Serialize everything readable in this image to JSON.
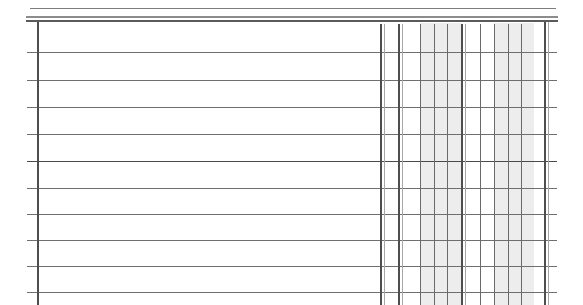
{
  "document": {
    "kind": "blank-ruled-table-grid",
    "title": "",
    "subtitle": "",
    "page_background": "#ffffff",
    "ink_color": "#6f6f6f",
    "shade_color": "#ededed",
    "canvas": {
      "width": 583,
      "height": 305
    }
  },
  "header_rules": [
    {
      "name": "masthead-top-rule",
      "x": 30,
      "y": 8,
      "width": 526,
      "thickness": 1,
      "tone": "#7d7d7d"
    },
    {
      "name": "masthead-mid-rule",
      "x": 26,
      "y": 16,
      "width": 532,
      "thickness": 2,
      "tone": "#8c8c8c"
    },
    {
      "name": "masthead-bottom-rule",
      "x": 26,
      "y": 20,
      "width": 532,
      "thickness": 2,
      "tone": "#5a5a5a"
    }
  ],
  "grid": {
    "left_border_x": 37,
    "right_border_x": 544,
    "body_top_y": 22,
    "body_bottom_y": 305,
    "row_rule_x_start": 27,
    "row_rule_x_end": 557,
    "row_rules_y": [
      52,
      80,
      107,
      134,
      161,
      188,
      214,
      240,
      266,
      292
    ],
    "row_count": 11,
    "row_height_avg": 27
  },
  "columns": {
    "label_column": {
      "name": "wide-label-column",
      "x_start": 37,
      "x_end": 380,
      "width": 343,
      "shaded": false,
      "header_text": "",
      "cells": [
        "",
        "",
        "",
        "",
        "",
        "",
        "",
        "",
        "",
        "",
        ""
      ]
    },
    "value_columns": [
      {
        "name": "value-col-1",
        "x": 380,
        "width": 18,
        "shaded": false,
        "header_text": "",
        "cells": [
          "",
          "",
          "",
          "",
          "",
          "",
          "",
          "",
          "",
          "",
          ""
        ]
      },
      {
        "name": "value-col-2",
        "x": 398,
        "width": 22,
        "shaded": false,
        "header_text": "",
        "cells": [
          "",
          "",
          "",
          "",
          "",
          "",
          "",
          "",
          "",
          "",
          ""
        ]
      },
      {
        "name": "value-col-3",
        "x": 420,
        "width": 14,
        "shaded": true,
        "header_text": "",
        "cells": [
          "",
          "",
          "",
          "",
          "",
          "",
          "",
          "",
          "",
          "",
          ""
        ]
      },
      {
        "name": "value-col-4",
        "x": 434,
        "width": 13,
        "shaded": true,
        "header_text": "",
        "cells": [
          "",
          "",
          "",
          "",
          "",
          "",
          "",
          "",
          "",
          "",
          ""
        ]
      },
      {
        "name": "value-col-5",
        "x": 447,
        "width": 14,
        "shaded": true,
        "header_text": "",
        "cells": [
          "",
          "",
          "",
          "",
          "",
          "",
          "",
          "",
          "",
          "",
          ""
        ]
      },
      {
        "name": "value-col-6",
        "x": 461,
        "width": 19,
        "shaded": false,
        "header_text": "",
        "cells": [
          "",
          "",
          "",
          "",
          "",
          "",
          "",
          "",
          "",
          "",
          ""
        ]
      },
      {
        "name": "value-col-7",
        "x": 480,
        "width": 14,
        "shaded": false,
        "header_text": "",
        "cells": [
          "",
          "",
          "",
          "",
          "",
          "",
          "",
          "",
          "",
          "",
          ""
        ]
      },
      {
        "name": "value-col-8",
        "x": 494,
        "width": 14,
        "shaded": true,
        "header_text": "",
        "cells": [
          "",
          "",
          "",
          "",
          "",
          "",
          "",
          "",
          "",
          "",
          ""
        ]
      },
      {
        "name": "value-col-9",
        "x": 508,
        "width": 13,
        "shaded": true,
        "header_text": "",
        "cells": [
          "",
          "",
          "",
          "",
          "",
          "",
          "",
          "",
          "",
          "",
          ""
        ]
      },
      {
        "name": "value-col-10",
        "x": 521,
        "width": 13,
        "shaded": true,
        "header_text": "",
        "cells": [
          "",
          "",
          "",
          "",
          "",
          "",
          "",
          "",
          "",
          "",
          ""
        ]
      },
      {
        "name": "value-col-11",
        "x": 534,
        "width": 10,
        "shaded": false,
        "header_text": "",
        "cells": [
          "",
          "",
          "",
          "",
          "",
          "",
          "",
          "",
          "",
          "",
          ""
        ]
      }
    ],
    "rule_x_positions": [
      380,
      383,
      398,
      401,
      420,
      434,
      447,
      461,
      464,
      480,
      494,
      508,
      521,
      534,
      544,
      547
    ]
  },
  "annotations": {
    "visible_text": [],
    "note": ""
  }
}
